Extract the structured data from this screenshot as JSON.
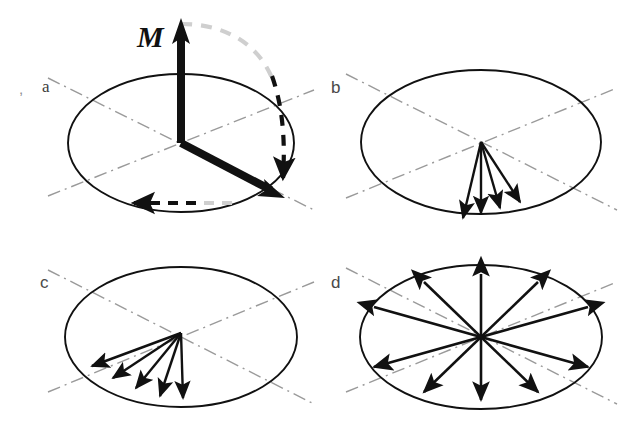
{
  "figure": {
    "background_color": "#ffffff",
    "ink_color": "#111111",
    "guide_color": "#9a9a9a",
    "faded_color": "#c9c9c9",
    "label_color": "#4a4a4a",
    "width": 639,
    "height": 432
  },
  "panels": [
    {
      "id": "a",
      "label": "a",
      "caption_artifact": ",",
      "ellipse": {
        "cx": 181,
        "cy": 143,
        "rx": 113,
        "ry": 69
      },
      "guides": [
        {
          "name": "guide-line-major",
          "x1": 48,
          "y1": 196,
          "x2": 314,
          "y2": 90
        },
        {
          "name": "guide-line-minor",
          "x1": 48,
          "y1": 78,
          "x2": 314,
          "y2": 210
        }
      ],
      "vectors": [
        {
          "name": "magnetization-vector-out-of-plane",
          "label": "M",
          "label_x": 140,
          "label_y": 45,
          "x1": 181,
          "y1": 143,
          "x2": 181,
          "y2": 22,
          "width": 8,
          "color": "#111111",
          "head": "end"
        },
        {
          "name": "magnetization-vector-in-plane",
          "x1": 181,
          "y1": 143,
          "x2": 281,
          "y2": 196,
          "width": 8,
          "color": "#111111",
          "head": "end"
        }
      ],
      "dashed_paths": [
        {
          "name": "precession-arc",
          "d": "M 181 24 C 243 24 281 70 283 183",
          "head_at": [
            283,
            183
          ],
          "head_angle": 90,
          "segments": "gray-to-black"
        },
        {
          "name": "in-plane-rotation-arrow",
          "x1": 226,
          "y1": 203,
          "x2": 130,
          "y2": 203,
          "head": "end",
          "segments": "gray-to-black"
        }
      ]
    },
    {
      "id": "b",
      "label": "b",
      "ellipse": {
        "cx": 481,
        "cy": 142,
        "rx": 120,
        "ry": 72
      },
      "guides": [
        {
          "name": "guide-line-major",
          "x1": 346,
          "y1": 198,
          "x2": 617,
          "y2": 88
        },
        {
          "name": "guide-line-minor",
          "x1": 346,
          "y1": 74,
          "x2": 617,
          "y2": 210
        }
      ],
      "fan": {
        "name": "domain-vector-fan",
        "origin": [
          481,
          142
        ],
        "arrows": [
          {
            "angle_deg": 103,
            "length": 78
          },
          {
            "angle_deg": 90,
            "length": 73
          },
          {
            "angle_deg": 76,
            "length": 70
          },
          {
            "angle_deg": 62,
            "length": 68
          }
        ],
        "count": 4
      }
    },
    {
      "id": "c",
      "label": "c",
      "ellipse": {
        "cx": 181,
        "cy": 337,
        "rx": 116,
        "ry": 70
      },
      "guides": [
        {
          "name": "guide-line-major",
          "x1": 48,
          "y1": 392,
          "x2": 314,
          "y2": 282
        },
        {
          "name": "guide-line-minor",
          "x1": 48,
          "y1": 270,
          "x2": 314,
          "y2": 404
        }
      ],
      "fan": {
        "name": "domain-vector-fan",
        "origin": [
          181,
          333
        ],
        "arrows": [
          {
            "angle_deg": 88,
            "length": 69
          },
          {
            "angle_deg": 108,
            "length": 68
          },
          {
            "angle_deg": 128,
            "length": 70
          },
          {
            "angle_deg": 146,
            "length": 76
          },
          {
            "angle_deg": 160,
            "length": 84
          }
        ],
        "count": 5
      }
    },
    {
      "id": "d",
      "label": "d",
      "ellipse": {
        "cx": 481,
        "cy": 337,
        "rx": 121,
        "ry": 72
      },
      "guides": [
        {
          "name": "guide-line-major",
          "x1": 346,
          "y1": 392,
          "x2": 617,
          "y2": 282
        },
        {
          "name": "guide-line-minor",
          "x1": 346,
          "y1": 268,
          "x2": 617,
          "y2": 404
        }
      ],
      "star": {
        "name": "isotropic-vector-star",
        "origin": [
          481,
          337
        ],
        "double_arrows": [
          {
            "angle_deg": 90,
            "length": 68
          },
          {
            "angle_deg": 50,
            "length": 88
          },
          {
            "angle_deg": 18,
            "length": 112
          },
          {
            "angle_deg": 162,
            "length": 112
          },
          {
            "angle_deg": 130,
            "length": 88
          }
        ],
        "ray_count": 10
      }
    }
  ]
}
